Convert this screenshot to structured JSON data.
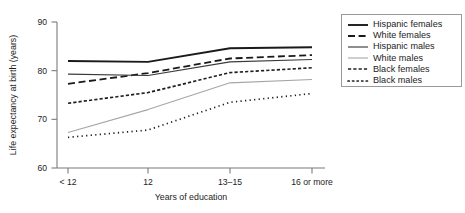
{
  "chart_data": {
    "type": "line",
    "title": "",
    "subtitle": "",
    "xlabel": "Years of education",
    "ylabel": "Life expectancy at birth (years)",
    "categories": [
      "< 12",
      "12",
      "13–15",
      "16 or more"
    ],
    "ylim": [
      60,
      90
    ],
    "yticks": [
      60,
      70,
      80,
      90
    ],
    "ytick_labels": [
      "60",
      "70",
      "80",
      "90"
    ],
    "grid": false,
    "legend_position": "right-outside",
    "series": [
      {
        "name": "Hispanic females",
        "values": [
          82.0,
          81.8,
          84.6,
          84.8
        ],
        "style": "solid",
        "color": "#1a1a1a",
        "width": 1.9,
        "dasharray": "none"
      },
      {
        "name": "White females",
        "values": [
          77.3,
          79.5,
          82.5,
          83.2
        ],
        "style": "dashed",
        "color": "#1a1a1a",
        "width": 1.8,
        "dasharray": "7,3.6"
      },
      {
        "name": "Hispanic males",
        "values": [
          79.3,
          79.0,
          81.8,
          82.3
        ],
        "style": "solid",
        "color": "#3a3a3a",
        "width": 1.15,
        "dasharray": "none"
      },
      {
        "name": "White males",
        "values": [
          67.3,
          72.0,
          77.5,
          78.2
        ],
        "style": "solid-light",
        "color": "#a6a6a6",
        "width": 1.1,
        "dasharray": "none"
      },
      {
        "name": "Black females",
        "values": [
          73.3,
          75.5,
          79.6,
          80.6
        ],
        "style": "short-dash",
        "color": "#1f1f1f",
        "width": 1.65,
        "dasharray": "3.2,2.1"
      },
      {
        "name": "Black males",
        "values": [
          66.3,
          67.8,
          73.5,
          75.3
        ],
        "style": "dotted",
        "color": "#1f1f1f",
        "width": 1.7,
        "dasharray": "1.25,3.3"
      }
    ]
  },
  "legend": {
    "entries": [
      {
        "label": "Hispanic females"
      },
      {
        "label": "White females"
      },
      {
        "label": "Hispanic males"
      },
      {
        "label": "White males"
      },
      {
        "label": "Black females"
      },
      {
        "label": "Black males"
      }
    ]
  },
  "layout": {
    "plot": {
      "left": 57,
      "right": 325,
      "top": 22,
      "bottom": 168
    },
    "xtick_px": [
      68,
      148,
      230,
      312
    ],
    "legend": {
      "left": 341,
      "top": 14,
      "width": 121,
      "height": 73
    }
  }
}
